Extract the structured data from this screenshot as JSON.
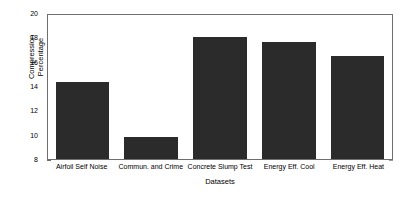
{
  "chart_data": {
    "type": "bar",
    "title": "",
    "xlabel": "Datasets",
    "ylabel_lines": [
      "Compression",
      "Percentage"
    ],
    "ylabel": "Compression Percentage",
    "categories": [
      "Airfoil Self Noise",
      "Commun. and Crime",
      "Concrete Slump Test",
      "Energy Eff. Cool",
      "Energy Eff. Heat"
    ],
    "values": [
      14.3,
      9.8,
      18.0,
      17.65,
      16.5
    ],
    "ylim": [
      8,
      20
    ],
    "yticks": [
      8,
      10,
      12,
      14,
      16,
      18,
      20
    ],
    "ytick_labels": [
      "8",
      "10",
      "12",
      "14",
      "16",
      "18",
      "20"
    ],
    "grid": false,
    "legend": null,
    "bar_color": "#2b2b2b",
    "axis_color": "#6e6e6e"
  }
}
